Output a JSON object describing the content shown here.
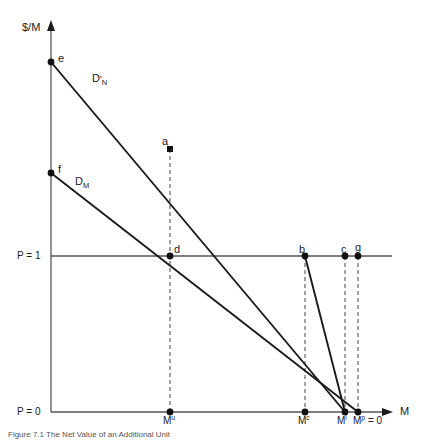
{
  "figure": {
    "domain": "diagram",
    "background": "#ffffff",
    "line_color": "#1a1a1a",
    "dash_color": "#555555",
    "width": 422,
    "height": 443
  },
  "axes": {
    "y_axis_title": "$/M",
    "x_axis_title": "M",
    "y_ticks": [
      {
        "label_prefix": "P = ",
        "label_value": "1",
        "y": 256
      },
      {
        "label_prefix": "P = ",
        "label_value": "0",
        "y": 412
      }
    ],
    "origin_x": 51,
    "origin_y": 412
  },
  "x_ticks": [
    {
      "id": "Mu",
      "base": "M",
      "sup": "u",
      "x": 170
    },
    {
      "id": "Mc",
      "base": "M",
      "sup": "c",
      "x": 305
    },
    {
      "id": "Mi",
      "base": "M",
      "sup": "i",
      "x": 345
    },
    {
      "id": "Mp",
      "base": "M",
      "sup": "p",
      "suffix": " = 0",
      "x": 358
    }
  ],
  "curves": [
    {
      "name": "D-prime-N",
      "base": "D",
      "prime": "'",
      "sub": "N",
      "label_x": 92,
      "label_y": 79,
      "from": {
        "x": 51,
        "y": 62
      },
      "to": {
        "x": 345,
        "y": 412
      }
    },
    {
      "name": "D-M",
      "base": "D",
      "prime": "",
      "sub": "M",
      "label_x": 75,
      "label_y": 181,
      "from": {
        "x": 51,
        "y": 173
      },
      "to": {
        "x": 358,
        "y": 412
      }
    }
  ],
  "steep_segment": {
    "name": "b-to-Mi",
    "from": {
      "x": 305,
      "y": 256
    },
    "to": {
      "x": 345,
      "y": 412
    }
  },
  "points": [
    {
      "id": "e",
      "label": "e",
      "x": 51,
      "y": 62,
      "lx": 58,
      "ly": 52,
      "filled": true
    },
    {
      "id": "f",
      "label": "f",
      "x": 51,
      "y": 173,
      "lx": 58,
      "ly": 163,
      "filled": true
    },
    {
      "id": "a",
      "label": "a",
      "x": 170,
      "y": 149,
      "lx": 163,
      "ly": 136,
      "filled": true
    },
    {
      "id": "d",
      "label": "d",
      "x": 170,
      "y": 256,
      "lx": 174,
      "ly": 243,
      "filled": true
    },
    {
      "id": "b",
      "label": "b",
      "x": 305,
      "y": 256,
      "lx": 299,
      "ly": 243,
      "filled": true
    },
    {
      "id": "c",
      "label": "c",
      "x": 345,
      "y": 256,
      "lx": 341,
      "ly": 243,
      "filled": true
    },
    {
      "id": "g",
      "label": "g",
      "x": 358,
      "y": 256,
      "lx": 355,
      "ly": 242,
      "filled": true
    },
    {
      "id": "Mu-dot",
      "label": "",
      "x": 170,
      "y": 412,
      "lx": 0,
      "ly": 0,
      "filled": true
    },
    {
      "id": "Mc-dot",
      "label": "",
      "x": 305,
      "y": 412,
      "lx": 0,
      "ly": 0,
      "filled": true
    },
    {
      "id": "Mi-dot",
      "label": "",
      "x": 345,
      "y": 412,
      "lx": 0,
      "ly": 0,
      "filled": true
    },
    {
      "id": "Mp-dot",
      "label": "",
      "x": 358,
      "y": 412,
      "lx": 0,
      "ly": 0,
      "filled": true
    }
  ],
  "dashed_verticals": [
    {
      "id": "dash-Mu",
      "x": 170,
      "y1": 149,
      "y2": 412
    },
    {
      "id": "dash-Mc",
      "x": 305,
      "y1": 256,
      "y2": 412
    },
    {
      "id": "dash-Mi",
      "x": 345,
      "y1": 256,
      "y2": 412
    },
    {
      "id": "dash-Mp",
      "x": 358,
      "y1": 256,
      "y2": 412
    }
  ],
  "price_line": {
    "id": "P1-line",
    "x1": 51,
    "x2": 392,
    "y": 256
  },
  "caption": "Figure 7.1  The Net Value of an Additional Unit"
}
